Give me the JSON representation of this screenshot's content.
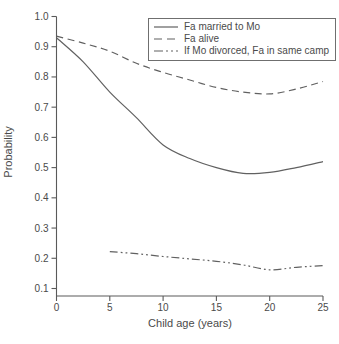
{
  "figure": {
    "bg_color": "#ffffff",
    "line_color": "#616161",
    "text_color": "#4a4a4a"
  },
  "chart_data": {
    "type": "line",
    "title": "",
    "xlabel": "Child age (years)",
    "ylabel": "Probability",
    "xlim": [
      0,
      25
    ],
    "ylim": [
      0.1,
      1.0
    ],
    "x_ticks": [
      0,
      5,
      10,
      15,
      20,
      25
    ],
    "y_ticks": [
      0.1,
      0.2,
      0.3,
      0.4,
      0.5,
      0.6,
      0.7,
      0.8,
      0.9,
      1.0
    ],
    "grid": false,
    "legend_position": "top-right",
    "series": [
      {
        "name": "Fa married to Mo",
        "style": "solid",
        "x": [
          0,
          2.5,
          5,
          7.5,
          10,
          12.5,
          15,
          17.5,
          20,
          22.5,
          25
        ],
        "y": [
          0.93,
          0.85,
          0.75,
          0.665,
          0.575,
          0.53,
          0.5,
          0.481,
          0.484,
          0.5,
          0.52
        ]
      },
      {
        "name": "Fa alive",
        "style": "dashed",
        "x": [
          0,
          2.5,
          5,
          7.5,
          10,
          12.5,
          15,
          17.5,
          20,
          22.5,
          25
        ],
        "y": [
          0.935,
          0.912,
          0.885,
          0.845,
          0.815,
          0.79,
          0.765,
          0.75,
          0.744,
          0.76,
          0.785
        ]
      },
      {
        "name": "If Mo divorced, Fa in same camp",
        "style": "dash-dot-dot",
        "x": [
          5,
          7.5,
          10,
          12.5,
          15,
          17.5,
          20,
          22.5,
          25
        ],
        "y": [
          0.222,
          0.215,
          0.206,
          0.198,
          0.19,
          0.178,
          0.162,
          0.17,
          0.176
        ]
      }
    ]
  }
}
